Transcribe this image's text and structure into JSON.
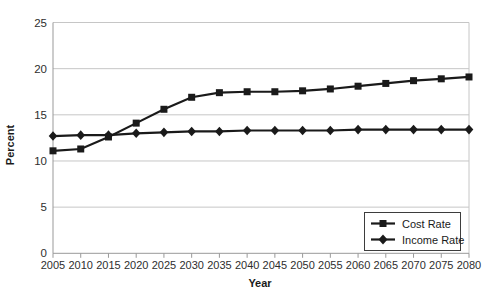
{
  "chart_data": {
    "type": "line",
    "title": "",
    "xlabel": "Year",
    "ylabel": "Percent",
    "x": [
      2005,
      2010,
      2015,
      2020,
      2025,
      2030,
      2035,
      2040,
      2045,
      2050,
      2055,
      2060,
      2065,
      2070,
      2075,
      2080
    ],
    "series": [
      {
        "name": "Cost Rate",
        "marker": "square",
        "values": [
          11.1,
          11.3,
          12.6,
          14.1,
          15.6,
          16.9,
          17.4,
          17.5,
          17.5,
          17.6,
          17.8,
          18.1,
          18.4,
          18.7,
          18.9,
          19.1
        ]
      },
      {
        "name": "Income Rate",
        "marker": "diamond",
        "values": [
          12.7,
          12.8,
          12.8,
          13.0,
          13.1,
          13.2,
          13.2,
          13.3,
          13.3,
          13.3,
          13.3,
          13.4,
          13.4,
          13.4,
          13.4,
          13.4
        ]
      }
    ],
    "xlim": [
      2005,
      2080
    ],
    "ylim": [
      0,
      25
    ],
    "yticks": [
      0,
      5,
      10,
      15,
      20,
      25
    ],
    "xticks": [
      2005,
      2010,
      2015,
      2020,
      2025,
      2030,
      2035,
      2040,
      2045,
      2050,
      2055,
      2060,
      2065,
      2070,
      2075,
      2080
    ],
    "grid": "horizontal",
    "legend_position": "bottom-right",
    "colors": {
      "line": "#1a1a1a",
      "grid": "#c6c6c6",
      "axis": "#999999",
      "tick_text": "#2e2e2e",
      "title_text": "#1a1a1a",
      "legend_border": "#3d3d3d",
      "background": "#ffffff"
    }
  }
}
